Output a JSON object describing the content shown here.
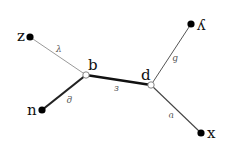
{
  "diagram": {
    "type": "tree",
    "nodes": [
      {
        "id": "z",
        "label": "z",
        "kind": "leaf",
        "x": 30,
        "y": 37
      },
      {
        "id": "b",
        "label": "b",
        "kind": "internal",
        "x": 86,
        "y": 75
      },
      {
        "id": "n",
        "label": "n",
        "kind": "leaf",
        "x": 42,
        "y": 110
      },
      {
        "id": "d",
        "label": "d",
        "kind": "internal",
        "x": 151,
        "y": 85
      },
      {
        "id": "y",
        "label": "ʎ",
        "kind": "leaf",
        "x": 191,
        "y": 24
      },
      {
        "id": "x",
        "label": "x",
        "kind": "leaf",
        "x": 201,
        "y": 133
      }
    ],
    "edges": [
      {
        "from": "z",
        "to": "b",
        "label": "λ",
        "weight": "thin"
      },
      {
        "from": "b",
        "to": "n",
        "label": "ϱ",
        "weight": "thick"
      },
      {
        "from": "b",
        "to": "d",
        "label": "з",
        "weight": "thick"
      },
      {
        "from": "d",
        "to": "y",
        "label": "ɓ",
        "weight": "thin"
      },
      {
        "from": "d",
        "to": "x",
        "label": "ʋ",
        "weight": "thin"
      }
    ],
    "colors": {
      "line_thin": "#888888",
      "line_medium": "#444444",
      "line_thick": "#111111",
      "node_fill": "#000000",
      "hollow_fill": "#ffffff",
      "label": "#111111",
      "edge_label": "#555555"
    }
  }
}
